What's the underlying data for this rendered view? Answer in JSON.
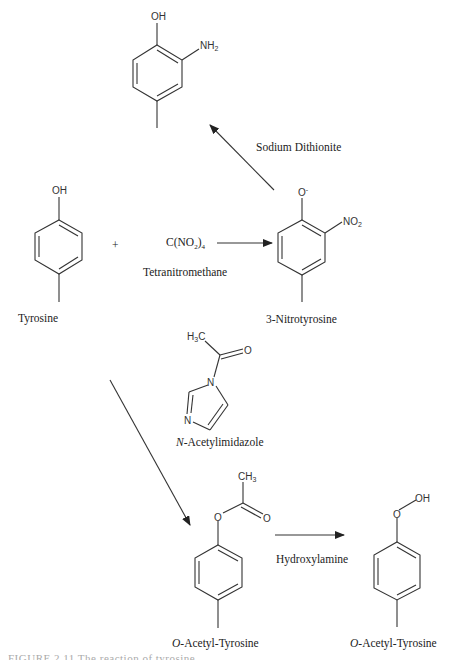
{
  "molecules": {
    "aminophenol": {
      "oh": "OH",
      "nh2_main": "NH",
      "nh2_sub": "2"
    },
    "tyrosine": {
      "oh": "OH",
      "label": "Tyrosine"
    },
    "nitrotyrosine": {
      "o": "O",
      "charge": "-",
      "no2_main": "NO",
      "no2_sub": "2",
      "label": "3-Nitrotyrosine"
    },
    "acetylimidazole": {
      "h3c_main": "H",
      "h3c_sub": "3",
      "h3c_c": "C",
      "o": "O",
      "n1": "N",
      "n3": "N",
      "label_italic": "N",
      "label_rest": "-Acetylimidazole"
    },
    "o_acetyl_tyrosine_1": {
      "ch3_main": "CH",
      "ch3_sub": "3",
      "o_ester": "O",
      "o_carbonyl": "O",
      "label_italic": "O",
      "label_rest": "-Acetyl-Tyrosine"
    },
    "o_acetyl_tyrosine_2": {
      "o": "O",
      "oh": "OH",
      "label_italic": "O",
      "label_rest": "-Acetyl-Tyrosine"
    }
  },
  "reagents": {
    "plus": "+",
    "tetranitromethane_formula_main": "C(NO",
    "tetranitromethane_formula_sub": "2",
    "tetranitromethane_formula_close": ")",
    "tetranitromethane_formula_sub2": "4",
    "tetranitromethane_name": "Tetranitromethane",
    "sodium_dithionite": "Sodium Dithionite",
    "hydroxylamine": "Hydroxylamine"
  },
  "caption": {
    "text": "FIGURE 2.11  The reaction of tyrosine ..."
  }
}
